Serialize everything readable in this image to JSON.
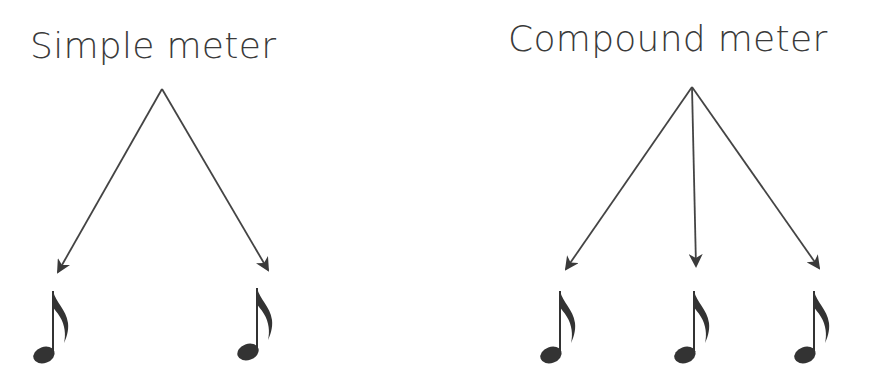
{
  "diagram": {
    "simple": {
      "title": "Simple meter",
      "notes": 2,
      "note_symbol": "eighth-note"
    },
    "compound": {
      "title": "Compound meter",
      "notes": 3,
      "note_symbol": "eighth-note"
    },
    "colors": {
      "text": "#3a3a3a",
      "lines": "#444444",
      "background": "#ffffff"
    }
  }
}
